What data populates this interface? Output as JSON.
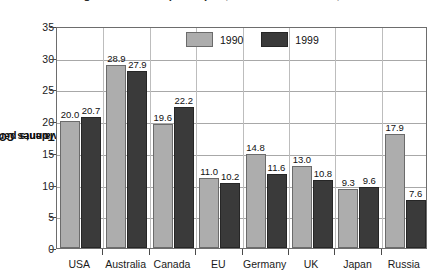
{
  "chart_data": {
    "type": "bar",
    "title": "Greenhouse gas emissions per capita, selected countries, 1990 and 1999",
    "xlabel": "",
    "ylabel_parts": {
      "pre": "Tonnes CO",
      "sub": "2",
      "post": " equivalents per capita"
    },
    "ylabel": "Tonnes CO2 equivalents per capita",
    "categories": [
      "USA",
      "Australia",
      "Canada",
      "EU",
      "Germany",
      "UK",
      "Japan",
      "Russia"
    ],
    "series": [
      {
        "name": "1990",
        "color": "#adadad",
        "values": [
          20.0,
          28.9,
          19.6,
          11.0,
          14.8,
          13.0,
          9.3,
          17.9
        ]
      },
      {
        "name": "1999",
        "color": "#3a3a3a",
        "values": [
          20.7,
          27.9,
          22.2,
          10.2,
          11.6,
          10.8,
          9.6,
          7.6
        ]
      }
    ],
    "value_labels": [
      [
        "20.0",
        "28.9",
        "19.6",
        "11.0",
        "14.8",
        "13.0",
        "9.3",
        "17.9"
      ],
      [
        "20.7",
        "27.9",
        "22.2",
        "10.2",
        "11.6",
        "10.8",
        "9.6",
        "7.6"
      ]
    ],
    "ylim": [
      0,
      35
    ],
    "yticks": [
      0,
      5,
      10,
      15,
      20,
      25,
      30,
      35
    ],
    "ytick_labels": [
      "0",
      "5",
      "10",
      "15",
      "20",
      "25",
      "30",
      "35"
    ],
    "grid": true,
    "legend_position": "top-center"
  }
}
